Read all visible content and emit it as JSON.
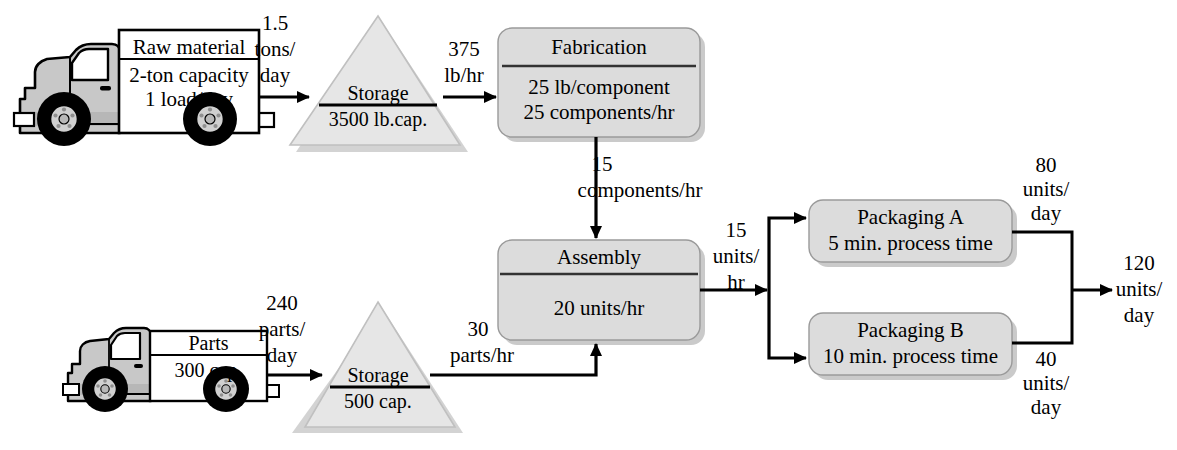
{
  "diagram": {
    "colors": {
      "box_fill": "#dcdcdc",
      "box_stroke": "#8a8a8a",
      "box_shadow": "#b4b4b4",
      "triangle_fill": "#e3e3e3",
      "triangle_stroke": "#bdbdbd",
      "truck_body": "#c8c8c8",
      "truck_outline": "#000000",
      "tire": "#000000",
      "hub": "#d0d0d0",
      "line": "#000000",
      "background": "#ffffff"
    }
  },
  "trucks": [
    {
      "id": "raw-material-truck",
      "cargo_title": "Raw material",
      "cargo_lines": [
        "2-ton capacity",
        "1 load/day"
      ]
    },
    {
      "id": "parts-truck",
      "cargo_title": "Parts",
      "cargo_lines": [
        "300 cap."
      ]
    }
  ],
  "storages": [
    {
      "id": "raw-material-storage",
      "title": "Storage",
      "capacity": "3500 lb.cap."
    },
    {
      "id": "parts-storage",
      "title": "Storage",
      "capacity": "500 cap."
    }
  ],
  "processes": [
    {
      "id": "fabrication",
      "title": "Fabrication",
      "divider": true,
      "body_lines": [
        "25 lb/component",
        "25 components/hr"
      ]
    },
    {
      "id": "assembly",
      "title": "Assembly",
      "divider": true,
      "body_lines": [
        "20 units/hr"
      ]
    },
    {
      "id": "packaging-a",
      "title": "Packaging A",
      "divider": false,
      "body_lines": [
        "5 min. process time"
      ]
    },
    {
      "id": "packaging-b",
      "title": "Packaging B",
      "divider": false,
      "body_lines": [
        "10 min. process time"
      ]
    }
  ],
  "flows": [
    {
      "id": "flow-truck1-to-storage1",
      "lines": [
        "1.5",
        "tons/",
        "day"
      ],
      "text": "1.5 tons/day"
    },
    {
      "id": "flow-storage1-to-fabrication",
      "lines": [
        "375",
        "lb/hr"
      ],
      "text": "375 lb/hr"
    },
    {
      "id": "flow-fabrication-to-assembly",
      "lines": [
        "15",
        "components/hr"
      ],
      "text": "15 components/hr"
    },
    {
      "id": "flow-assembly-to-packaging",
      "lines": [
        "15",
        "units/",
        "hr"
      ],
      "text": "15 units/hr"
    },
    {
      "id": "flow-truck2-to-storage2",
      "lines": [
        "240",
        "parts/",
        "day"
      ],
      "text": "240 parts/day"
    },
    {
      "id": "flow-storage2-to-assembly",
      "lines": [
        "30",
        "parts/hr"
      ],
      "text": "30 parts/hr"
    },
    {
      "id": "flow-packaging-a-out",
      "lines": [
        "80",
        "units/",
        "day"
      ],
      "text": "80 units/day"
    },
    {
      "id": "flow-packaging-b-out",
      "lines": [
        "40",
        "units/",
        "day"
      ],
      "text": "40 units/day"
    },
    {
      "id": "flow-total-output",
      "lines": [
        "120",
        "units/",
        "day"
      ],
      "text": "120 units/day"
    }
  ]
}
